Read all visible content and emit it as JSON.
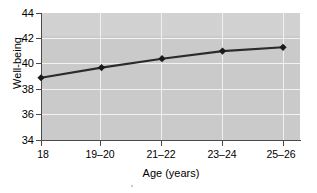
{
  "chart_data": {
    "type": "line",
    "title": "",
    "xlabel": "Age (years)",
    "ylabel": "Well-being",
    "categories": [
      "18",
      "19–20",
      "21–22",
      "23–24",
      "25–26"
    ],
    "values": [
      38.9,
      39.7,
      40.4,
      41.0,
      41.3
    ],
    "series": [
      {
        "name": "Well-being",
        "values": [
          38.9,
          39.7,
          40.4,
          41.0,
          41.3
        ]
      }
    ],
    "ylim": [
      34,
      44
    ],
    "yticks": [
      34,
      36,
      38,
      40,
      42,
      44
    ],
    "ytick_labels": [
      "34",
      "36",
      "38",
      "40",
      "42",
      "44"
    ],
    "xtick_labels": [
      "18",
      "19–20",
      "21–22",
      "23–24",
      "25–26"
    ],
    "grid": true,
    "grid_axis": "both",
    "legend": false,
    "legend_position": "none",
    "marker": "diamond",
    "line_color": "#2b2b2b",
    "marker_color": "#1a1a1a",
    "plot_background_color": "#c9c9c9",
    "gridline_color": "#f2f2f2",
    "axis_color": "#4a4a4a",
    "figure_background_color": "#ffffff"
  },
  "axes": {
    "y_title": "Well-being",
    "x_title": "Age (years)"
  }
}
